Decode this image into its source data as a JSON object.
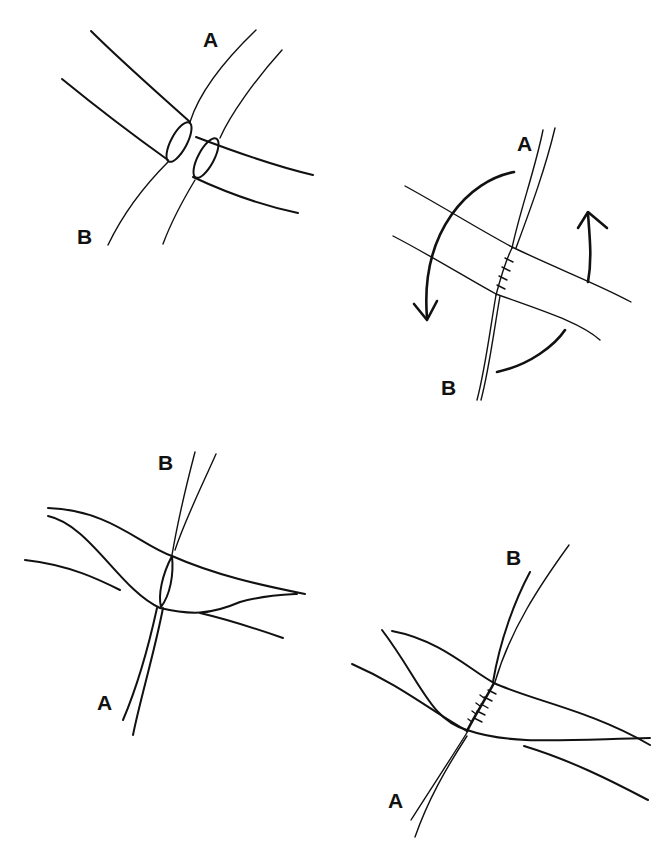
{
  "figure": {
    "panels": [
      {
        "id": "panel-1",
        "position": "top-left",
        "labels": {
          "vessel_a": "A",
          "vessel_b": "B"
        },
        "content": "Two vessels crossing with opened hatched elliptical ends facing each other"
      },
      {
        "id": "panel-2",
        "position": "top-right",
        "labels": {
          "vessel_a": "A",
          "vessel_b": "B"
        },
        "content": "Sutured back wall with curved rotation arrows"
      },
      {
        "id": "panel-3",
        "position": "bottom-left",
        "labels": {
          "vessel_a": "A",
          "vessel_b": "B"
        },
        "content": "Rotated vessel showing hatched opening"
      },
      {
        "id": "panel-4",
        "position": "bottom-right",
        "labels": {
          "vessel_a": "A",
          "vessel_b": "B"
        },
        "content": "Completed anastomosis with sutures"
      }
    ],
    "colors": {
      "ink": "#111111",
      "background": "#ffffff"
    }
  }
}
